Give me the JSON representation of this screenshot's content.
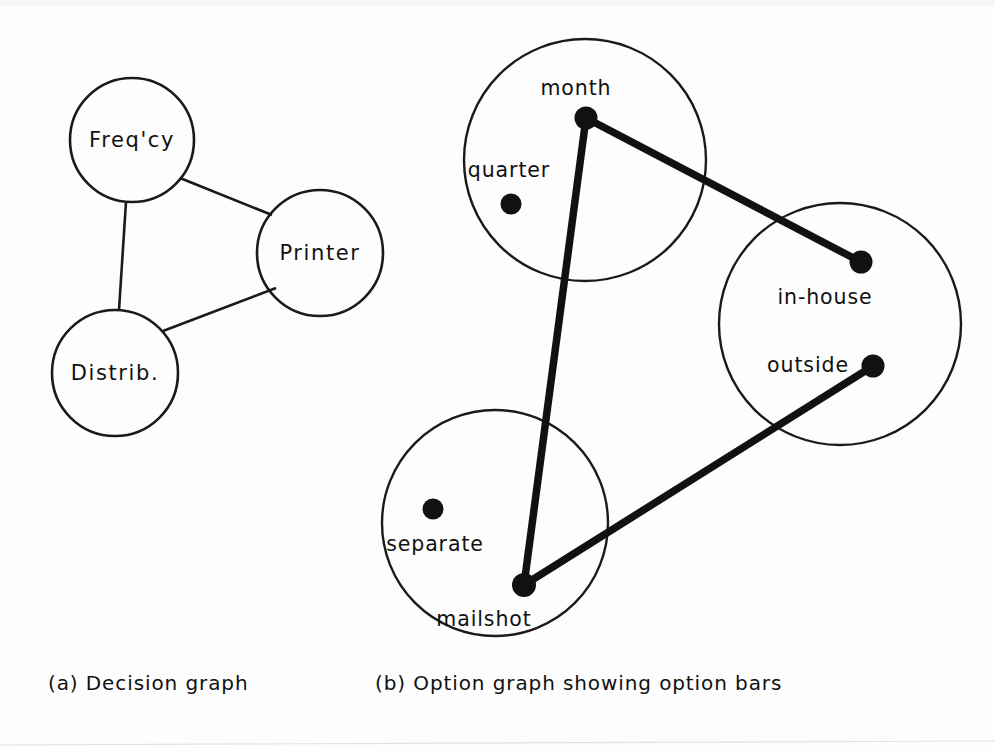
{
  "figure": {
    "background_color": "#fdfdfd",
    "ink_color": "#111111",
    "panels": [
      {
        "id": "a",
        "caption": "(a) Decision graph",
        "caption_x": 48,
        "caption_y": 690,
        "type": "decision-graph",
        "nodes": [
          {
            "id": "freqcy",
            "label": "Freq'cy",
            "cx": 132,
            "cy": 140,
            "r": 62,
            "label_x": 132,
            "label_y": 147
          },
          {
            "id": "printer",
            "label": "Printer",
            "cx": 320,
            "cy": 253,
            "r": 63,
            "label_x": 320,
            "label_y": 260
          },
          {
            "id": "distrib",
            "label": "Distrib.",
            "cx": 115,
            "cy": 373,
            "r": 63,
            "label_x": 115,
            "label_y": 380
          }
        ],
        "edges": [
          {
            "from": "freqcy",
            "to": "printer",
            "x1": 180,
            "y1": 178,
            "x2": 272,
            "y2": 215
          },
          {
            "from": "freqcy",
            "to": "distrib",
            "x1": 126,
            "y1": 202,
            "x2": 119,
            "y2": 310
          },
          {
            "from": "distrib",
            "to": "printer",
            "x1": 163,
            "y1": 331,
            "x2": 276,
            "y2": 288
          }
        ]
      },
      {
        "id": "b",
        "caption": "(b) Option graph showing option bars",
        "caption_x": 375,
        "caption_y": 690,
        "type": "option-graph",
        "clusters": [
          {
            "id": "timing",
            "cx": 585,
            "cy": 160,
            "r": 121,
            "options": [
              {
                "id": "month",
                "label": "month",
                "dot_x": 586,
                "dot_y": 118,
                "dot_r": 11.5,
                "label_x": 576,
                "label_y": 95,
                "anchor": "middle",
                "connected": true
              },
              {
                "id": "quarter",
                "label": "quarter",
                "dot_x": 511,
                "dot_y": 204,
                "dot_r": 10.5,
                "label_x": 509,
                "label_y": 177,
                "anchor": "middle",
                "connected": false
              }
            ]
          },
          {
            "id": "production",
            "cx": 840,
            "cy": 324,
            "r": 121,
            "options": [
              {
                "id": "in-house",
                "label": "in-house",
                "dot_x": 861,
                "dot_y": 262,
                "dot_r": 11.5,
                "label_x": 825,
                "label_y": 304,
                "anchor": "middle",
                "connected": true
              },
              {
                "id": "outside",
                "label": "outside",
                "dot_x": 873,
                "dot_y": 366,
                "dot_r": 11.5,
                "label_x": 808,
                "label_y": 372,
                "anchor": "middle",
                "connected": true
              }
            ]
          },
          {
            "id": "delivery",
            "cx": 495,
            "cy": 523,
            "r": 113,
            "options": [
              {
                "id": "separate",
                "label": "separate",
                "dot_x": 433,
                "dot_y": 509,
                "dot_r": 10.5,
                "label_x": 435,
                "label_y": 551,
                "anchor": "middle",
                "connected": false
              },
              {
                "id": "mailshot",
                "label": "mailshot",
                "dot_x": 524,
                "dot_y": 585,
                "dot_r": 12,
                "label_x": 484,
                "label_y": 626,
                "anchor": "middle",
                "connected": true
              }
            ]
          }
        ],
        "option_bars": [
          {
            "id": "bar-month-inhouse",
            "from": "month",
            "to": "in-house",
            "x1": 586,
            "y1": 118,
            "x2": 861,
            "y2": 262
          },
          {
            "id": "bar-month-mailshot",
            "from": "month",
            "to": "mailshot",
            "x1": 586,
            "y1": 118,
            "x2": 524,
            "y2": 585
          },
          {
            "id": "bar-mailshot-outside",
            "from": "mailshot",
            "to": "outside",
            "x1": 524,
            "y1": 585,
            "x2": 873,
            "y2": 366
          }
        ]
      }
    ]
  }
}
